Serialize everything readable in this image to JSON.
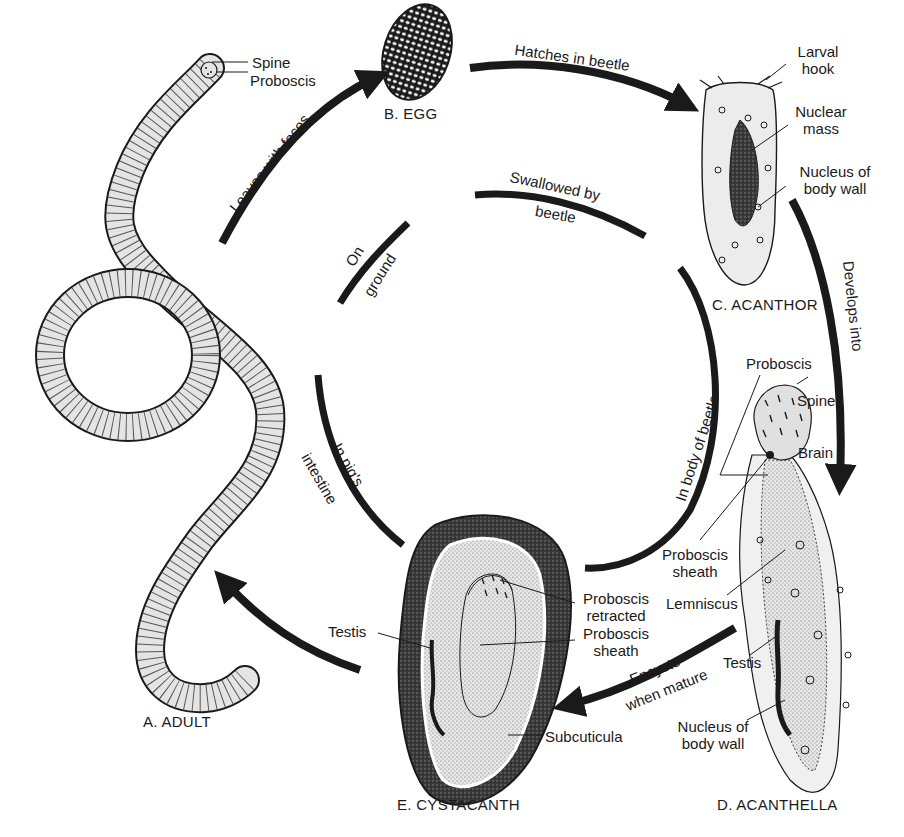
{
  "diagram": {
    "type": "life-cycle",
    "stages": {
      "adult": "A. ADULT",
      "egg": "B. EGG",
      "acanthor": "C. ACANTHOR",
      "acanthella": "D. ACANTHELLA",
      "cystacanth": "E. CYSTACANTH"
    },
    "outer_arrows": {
      "leaves_with_feces": "Leaves with feces",
      "hatches_in_beetle": "Hatches in beetle",
      "develops_into": "Develops into",
      "encysts_line1": "Encysts",
      "encysts_line2": "when mature"
    },
    "inner_arcs": {
      "on_ground_line1": "On",
      "on_ground_line2": "ground",
      "swallowed_line1": "Swallowed by",
      "swallowed_line2": "beetle",
      "body_of_beetle": "In body of beetle",
      "pig_line1": "In pig's",
      "pig_line2": "intestine"
    },
    "adult_labels": {
      "spine": "Spine",
      "proboscis": "Proboscis"
    },
    "acanthor_labels": {
      "larval_hook_1": "Larval",
      "larval_hook_2": "hook",
      "nuclear_mass_1": "Nuclear",
      "nuclear_mass_2": "mass",
      "nucleus_1": "Nucleus of",
      "nucleus_2": "body wall"
    },
    "acanthella_labels": {
      "proboscis": "Proboscis",
      "spine": "Spine",
      "brain": "Brain",
      "proboscis_sheath_1": "Proboscis",
      "proboscis_sheath_2": "sheath",
      "lemniscus": "Lemniscus",
      "testis": "Testis",
      "nucleus_1": "Nucleus of",
      "nucleus_2": "body wall"
    },
    "cystacanth_labels": {
      "testis": "Testis",
      "proboscis_retracted_1": "Proboscis",
      "proboscis_retracted_2": "retracted",
      "proboscis_sheath_1": "Proboscis",
      "proboscis_sheath_2": "sheath",
      "subcuticula": "Subcuticula"
    },
    "colors": {
      "ink": "#1a1a1a",
      "body_fill": "#e4e4e4",
      "stipple_fill": "#cfcfcf",
      "cyst_dark": "#3a3a3a",
      "background": "#ffffff"
    }
  }
}
